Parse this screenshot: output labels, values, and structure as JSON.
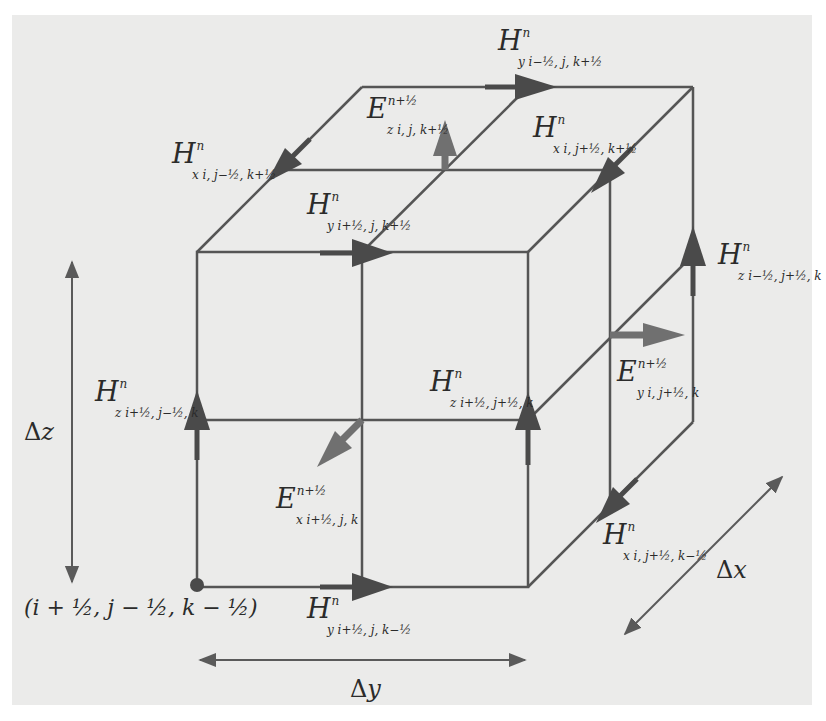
{
  "figure": {
    "colors": {
      "background_panel": "#ebebea",
      "line": "#555555",
      "h_arrow": "#4a4a4a",
      "e_arrow": "#6e6e6e",
      "text": "#2b2b2b"
    }
  },
  "labels": {
    "hy_top_back": {
      "base": "H",
      "sup": "n",
      "sub": "y i−½, j, k+½"
    },
    "ez_top": {
      "base": "E",
      "sup": "n+½",
      "sub": "z i, j, k+½"
    },
    "hx_top_left": {
      "base": "H",
      "sup": "n",
      "sub": "x i, j−½, k+½"
    },
    "hx_top_right": {
      "base": "H",
      "sup": "n",
      "sub": "x i, j+½, k+½"
    },
    "hy_top_front": {
      "base": "H",
      "sup": "n",
      "sub": "y i+½, j, k+½"
    },
    "hz_back_right": {
      "base": "H",
      "sup": "n",
      "sub": "z i−½, j+½, k"
    },
    "hz_front_left": {
      "base": "H",
      "sup": "n",
      "sub": "z i+½, j−½, k"
    },
    "hz_front_right": {
      "base": "H",
      "sup": "n",
      "sub": "z i+½, j+½, k"
    },
    "ey_right": {
      "base": "E",
      "sup": "n+½",
      "sub": "y i, j+½, k"
    },
    "ex_front": {
      "base": "E",
      "sup": "n+½",
      "sub": "x i+½, j, k"
    },
    "hx_bottom_right": {
      "base": "H",
      "sup": "n",
      "sub": "x i, j+½, k−½"
    },
    "hy_bottom_front": {
      "base": "H",
      "sup": "n",
      "sub": "y i+½, j, k−½"
    }
  },
  "dimensions": {
    "dz": {
      "delta": "Δ",
      "var": "z"
    },
    "dy": {
      "delta": "Δ",
      "var": "y"
    },
    "dx": {
      "delta": "Δ",
      "var": "x"
    }
  },
  "origin": {
    "coordinate": "(i + ½, j − ½, k − ½)"
  }
}
